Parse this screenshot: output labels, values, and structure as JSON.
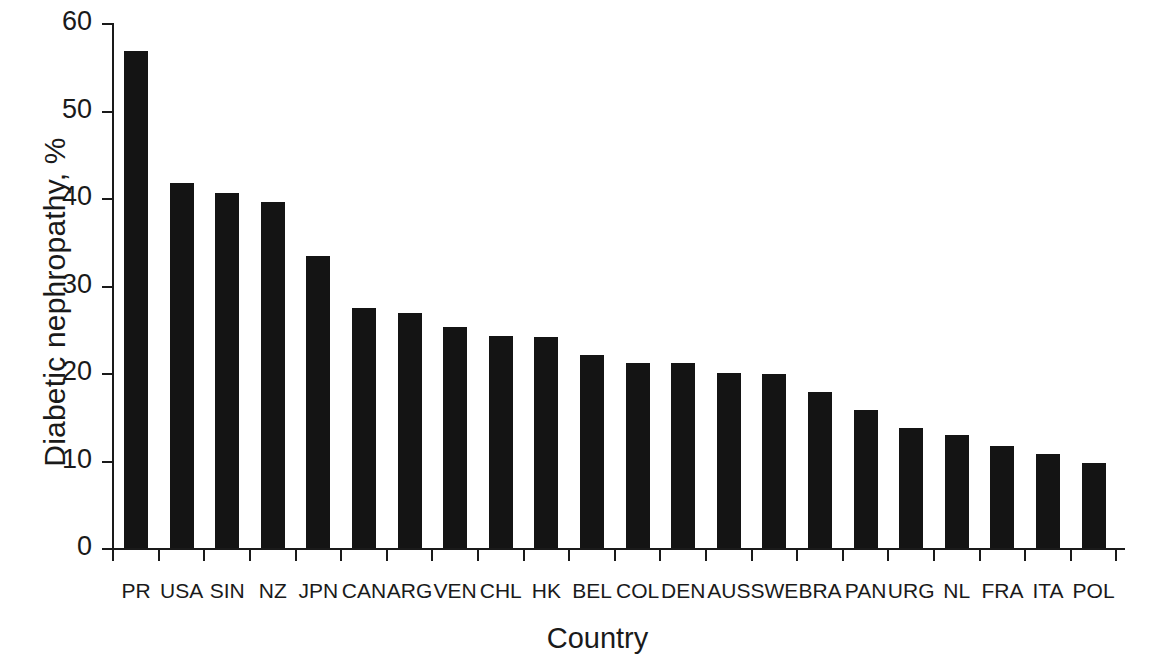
{
  "chart_data": {
    "type": "bar",
    "title": "",
    "xlabel": "Country",
    "ylabel": "Diabetic nephropathy, %",
    "ylim": [
      0,
      60
    ],
    "ytick_labels": [
      "60",
      "50",
      "40",
      "30",
      "20",
      "10",
      "0"
    ],
    "ytick_values": [
      60,
      50,
      40,
      30,
      20,
      10,
      0
    ],
    "grid": false,
    "legend": null,
    "categories": [
      "PR",
      "USA",
      "SIN",
      "NZ",
      "JPN",
      "CAN",
      "ARG",
      "VEN",
      "CHL",
      "HK",
      "BEL",
      "COL",
      "DEN",
      "AUS",
      "SWE",
      "BRA",
      "PAN",
      "URG",
      "NL",
      "FRA",
      "ITA",
      "POL"
    ],
    "values": [
      56.8,
      41.7,
      40.6,
      39.6,
      33.4,
      27.4,
      26.9,
      25.3,
      24.2,
      24.1,
      22.1,
      21.2,
      21.1,
      20.0,
      19.9,
      17.8,
      15.8,
      13.7,
      12.9,
      11.7,
      10.7,
      9.7
    ],
    "bar_color": "#141414",
    "axis_color": "#1a1a1a",
    "background_color": "#ffffff"
  }
}
